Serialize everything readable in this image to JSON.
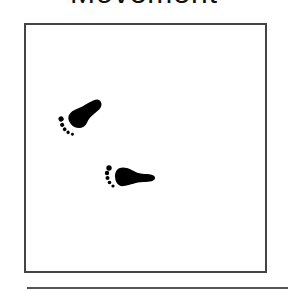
{
  "title": "Movement",
  "card": {
    "image_description": "footprints",
    "footprints": [
      {
        "name": "left-footprint",
        "x": 56,
        "y": 97,
        "rotation": -35
      },
      {
        "name": "right-footprint",
        "x": 103,
        "y": 162,
        "rotation": 0
      }
    ]
  },
  "colors": {
    "ink": "#000000",
    "frame": "#444444",
    "separator": "#555555"
  }
}
